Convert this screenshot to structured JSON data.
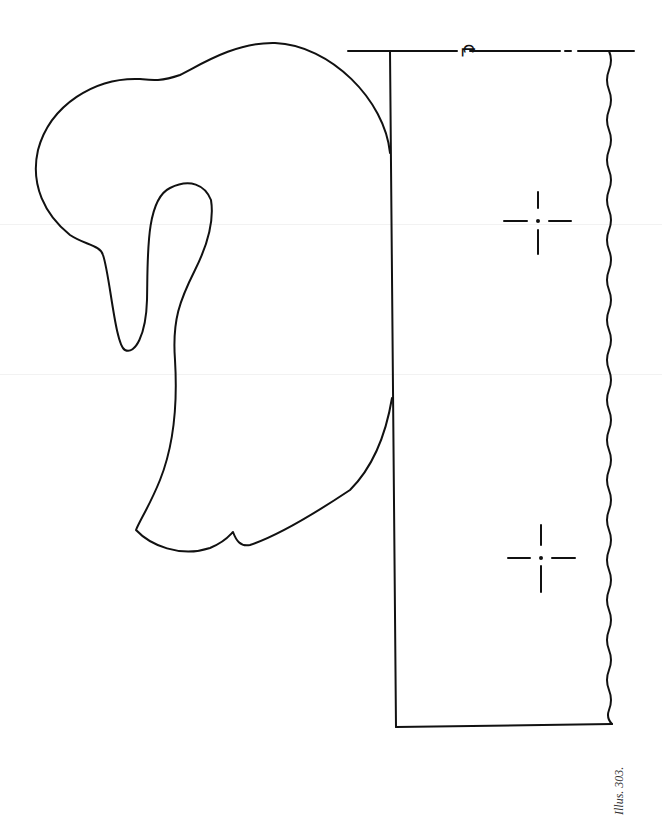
{
  "figure": {
    "caption": "Illus. 303.",
    "centerline_symbol": "℄",
    "stroke_color": "#111111",
    "background_color": "#ffffff"
  },
  "elements": {
    "profile": "swan-head-and-neck-outline",
    "base": "rectangular-base-with-wavy-edge",
    "markers": [
      {
        "name": "drill-center-mark-1",
        "cx": 538,
        "cy": 220
      },
      {
        "name": "drill-center-mark-2",
        "cx": 541,
        "cy": 557
      }
    ]
  }
}
